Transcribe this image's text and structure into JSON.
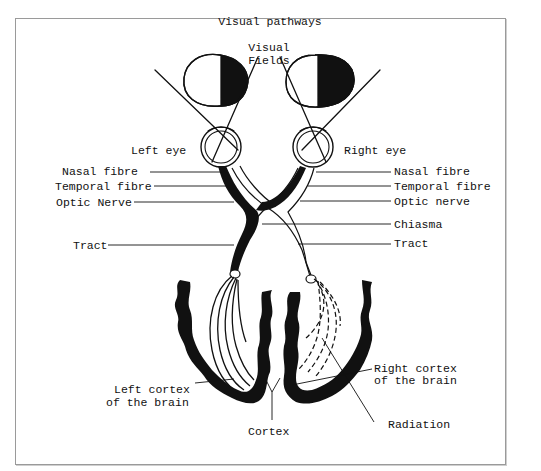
{
  "title": "Visual pathways",
  "labels": {
    "visual_fields_line1": "Visual",
    "visual_fields_line2": "Fields",
    "left_eye": "Left eye",
    "right_eye": "Right eye",
    "left_nasal_fibre": "Nasal fibre",
    "left_temporal_fibre": "Temporal fibre",
    "left_optic_nerve": "Optic Nerve",
    "left_tract": "Tract",
    "right_nasal_fibre": "Nasal fibre",
    "right_temporal_fibre": "Temporal fibre",
    "right_optic_nerve": "Optic nerve",
    "chiasma": "Chiasma",
    "right_tract": "Tract",
    "left_cortex_line1": "Left cortex",
    "left_cortex_line2": "of the brain",
    "right_cortex_line1": "Right cortex",
    "right_cortex_line2": "of the brain",
    "cortex": "Cortex",
    "radiation": "Radiation"
  },
  "colors": {
    "ink": "#111111",
    "frame": "#9a9a9a",
    "background": "#ffffff"
  }
}
